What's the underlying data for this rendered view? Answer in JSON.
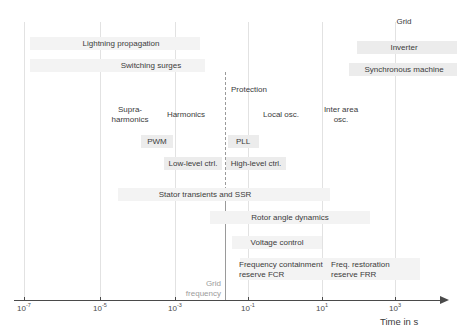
{
  "figure": {
    "type": "timescale-diagram",
    "axis": {
      "title": "Time in s",
      "scale": "log10",
      "ticks": [
        {
          "label_base": "10",
          "exponent": "-7",
          "x": 24
        },
        {
          "label_base": "10",
          "exponent": "-5",
          "x": 100
        },
        {
          "label_base": "10",
          "exponent": "-3",
          "x": 175
        },
        {
          "label_base": "10",
          "exponent": "-1",
          "x": 248
        },
        {
          "label_base": "10",
          "exponent": "1",
          "x": 322
        },
        {
          "label_base": "10",
          "exponent": "3",
          "x": 395
        }
      ]
    },
    "annotations": {
      "grid_frequency_line1": "Grid",
      "grid_frequency_line2": "frequency"
    },
    "phenomena": [
      {
        "name": "grid",
        "label": "Grid"
      },
      {
        "name": "inverter",
        "label": "Inverter"
      },
      {
        "name": "synchronous-machine",
        "label": "Synchronous machine"
      },
      {
        "name": "lightning-propagation",
        "label": "Lightning propagation"
      },
      {
        "name": "switching-surges",
        "label": "Switching surges"
      },
      {
        "name": "protection",
        "label": "Protection"
      },
      {
        "name": "supra-harmonics",
        "label": "Supra-\nharmonics"
      },
      {
        "name": "harmonics",
        "label": "Harmonics"
      },
      {
        "name": "local-osc",
        "label": "Local osc."
      },
      {
        "name": "inter-area-osc",
        "label": "Inter area\nosc."
      },
      {
        "name": "pwm",
        "label": "PWM"
      },
      {
        "name": "pll",
        "label": "PLL"
      },
      {
        "name": "low-level-ctrl",
        "label": "Low-level ctrl."
      },
      {
        "name": "high-level-ctrl",
        "label": "High-level ctrl."
      },
      {
        "name": "stator-transients-ssr",
        "label": "Stator transients and SSR"
      },
      {
        "name": "rotor-angle-dynamics",
        "label": "Rotor angle dynamics"
      },
      {
        "name": "voltage-control",
        "label": "Voltage control"
      },
      {
        "name": "fcr",
        "label": "Frequency containment\nreserve FCR"
      },
      {
        "name": "frr",
        "label": "Freq. restoration\nreserve FRR"
      }
    ],
    "colors": {
      "band": "#ececec",
      "band_faint": "#f3f3f3",
      "gridline": "#e2e2e2",
      "axis": "#4a4a4a",
      "text": "#3b3b3b",
      "note": "#9b9b9b"
    }
  }
}
